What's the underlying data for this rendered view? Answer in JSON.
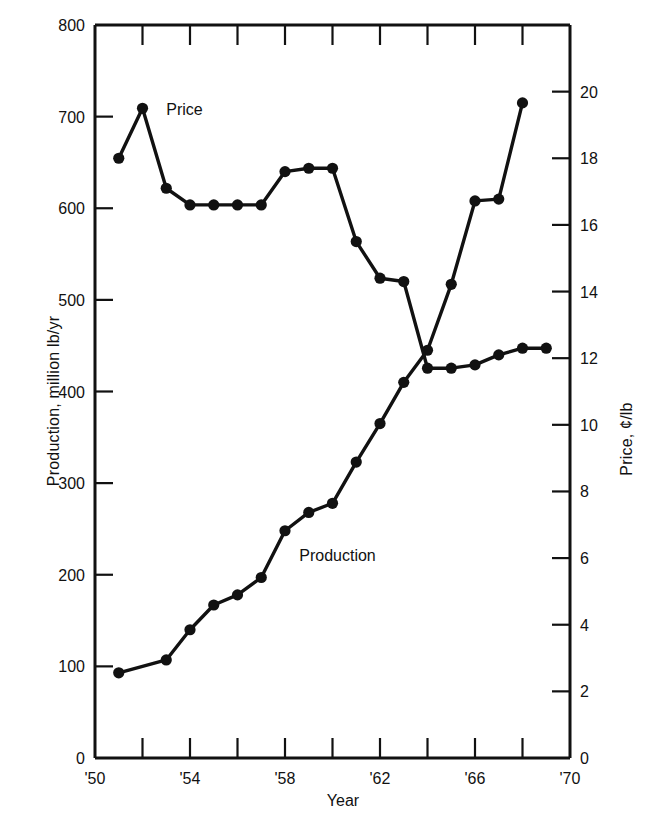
{
  "figure": {
    "xlabel": "Year",
    "ylabel_left": "Production, million lb/yr",
    "ylabel_right": "Price, ¢/lb",
    "series_label_price": "Price",
    "series_label_production": "Production"
  },
  "axes": {
    "left_ticks": [
      "0",
      "100",
      "200",
      "300",
      "400",
      "500",
      "600",
      "700",
      "800"
    ],
    "right_ticks": [
      "0",
      "2",
      "4",
      "6",
      "8",
      "10",
      "12",
      "14",
      "16",
      "18",
      "20"
    ],
    "x_ticks": [
      "'50",
      "",
      "'54",
      "",
      "'58",
      "",
      "'62",
      "",
      "'66",
      "",
      "'70"
    ],
    "x_tick_years": [
      1950,
      1952,
      1954,
      1956,
      1958,
      1960,
      1962,
      1964,
      1966,
      1968,
      1970
    ]
  },
  "chart_data": {
    "type": "line",
    "title": "",
    "xlabel": "Year",
    "ylabel": "Production, million lb/yr",
    "ylabel_secondary": "Price, ¢/lb",
    "xlim": [
      1950,
      1970
    ],
    "ylim": [
      0,
      800
    ],
    "ylim_secondary": [
      0,
      22
    ],
    "xticks": [
      1950,
      1952,
      1954,
      1956,
      1958,
      1960,
      1962,
      1964,
      1966,
      1968,
      1970
    ],
    "xticklabels": [
      "'50",
      "",
      "'54",
      "",
      "'58",
      "",
      "'62",
      "",
      "'66",
      "",
      "'70"
    ],
    "yticks": [
      0,
      100,
      200,
      300,
      400,
      500,
      600,
      700,
      800
    ],
    "yticks_secondary": [
      0,
      2,
      4,
      6,
      8,
      10,
      12,
      14,
      16,
      18,
      20
    ],
    "grid": false,
    "legend": "inline-annotations",
    "markers": "filled-circle",
    "series": [
      {
        "name": "Production",
        "axis": "left",
        "units": "million lb/yr",
        "x": [
          1951,
          1953,
          1954,
          1955,
          1956,
          1957,
          1958,
          1959,
          1960,
          1961,
          1962,
          1963,
          1964,
          1965,
          1966,
          1967,
          1968
        ],
        "values": [
          93,
          107,
          140,
          167,
          178,
          197,
          248,
          268,
          278,
          323,
          365,
          410,
          445,
          517,
          608,
          610,
          715
        ]
      },
      {
        "name": "Price",
        "axis": "right",
        "units": "¢/lb",
        "x": [
          1951,
          1952,
          1953,
          1954,
          1955,
          1956,
          1957,
          1958,
          1959,
          1960,
          1961,
          1962,
          1963,
          1964,
          1965,
          1966,
          1967,
          1968,
          1969
        ],
        "values": [
          18.0,
          19.5,
          17.1,
          16.6,
          16.6,
          16.6,
          16.6,
          17.6,
          17.7,
          17.7,
          15.5,
          14.4,
          14.3,
          11.7,
          11.7,
          11.8,
          12.1,
          12.3,
          12.3
        ]
      }
    ],
    "annotations": [
      {
        "text": "Price",
        "x": 1953.0,
        "y_secondary": 19.3
      },
      {
        "text": "Production",
        "x": 1958.6,
        "y": 215
      }
    ]
  }
}
